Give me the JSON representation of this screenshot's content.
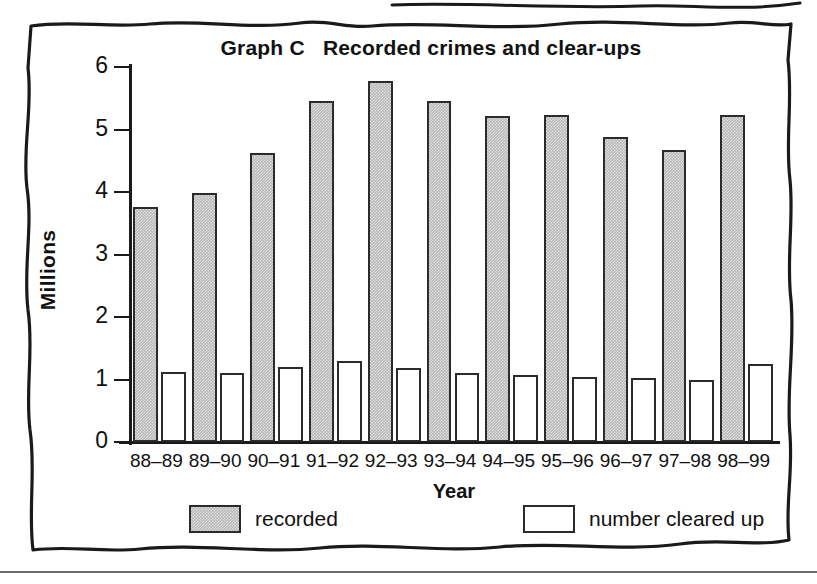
{
  "chart_data": {
    "type": "bar",
    "title": "Graph C   Recorded crimes and clear-ups",
    "title_prefix": "Graph C",
    "title_rest": "Recorded crimes and clear-ups",
    "xlabel": "Year",
    "ylabel": "Millions",
    "ylim": [
      0,
      6
    ],
    "y_ticks": [
      0,
      1,
      2,
      3,
      4,
      5,
      6
    ],
    "y_tick_labels": [
      "0",
      "1",
      "2",
      "3",
      "4",
      "5",
      "6"
    ],
    "grid": false,
    "legend_position": "bottom",
    "categories": [
      "88–89",
      "89–90",
      "90–91",
      "91–92",
      "92–93",
      "93–94",
      "94–95",
      "95–96",
      "96–97",
      "97–98",
      "98–99"
    ],
    "series": [
      {
        "name": "recorded",
        "color": "#b8b8b8",
        "values": [
          3.76,
          3.98,
          4.62,
          5.46,
          5.77,
          5.45,
          5.21,
          5.23,
          4.88,
          4.67,
          5.23
        ]
      },
      {
        "name": "number cleared up",
        "color": "#ffffff",
        "values": [
          1.12,
          1.11,
          1.2,
          1.29,
          1.19,
          1.1,
          1.08,
          1.04,
          1.03,
          0.99,
          1.25
        ]
      }
    ]
  },
  "legend": {
    "items": [
      {
        "label": "recorded",
        "swatch": "gray-filled-swatch"
      },
      {
        "label": "number cleared up",
        "swatch": "white-outline-swatch"
      }
    ]
  },
  "colors": {
    "bar_recorded_fill": "#b8b8b8",
    "bar_cleared_fill": "#ffffff",
    "bar_outline": "#2b2b2b",
    "axis": "#1a1a1a",
    "text": "#111111",
    "page_background": "#ffffff",
    "bottom_rule": "#6d6d6d"
  }
}
